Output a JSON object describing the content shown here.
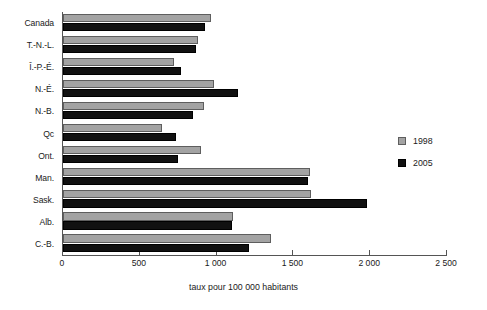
{
  "chart_data": {
    "type": "bar",
    "orientation": "horizontal",
    "title": "",
    "subtitle": "",
    "xlabel": "taux pour 100 000 habitants",
    "ylabel": "",
    "xlim": [
      0,
      2500
    ],
    "xticks": [
      0,
      500,
      1000,
      1500,
      2000,
      2500
    ],
    "xtick_labels": [
      "0",
      "500",
      "1 000",
      "1 500",
      "2 000",
      "2 500"
    ],
    "grid": false,
    "legend_position": "right",
    "categories": [
      "Canada",
      "T.-N.-L.",
      "Î.-P.-É.",
      "N.-É.",
      "N.-B.",
      "Qc",
      "Ont.",
      "Man.",
      "Sask.",
      "Alb.",
      "C.-B."
    ],
    "series": [
      {
        "name": "1998",
        "color": "#a3a3a3",
        "values": [
          963,
          879,
          723,
          983,
          918,
          645,
          898,
          1608,
          1615,
          1107,
          1354
        ]
      },
      {
        "name": "2005",
        "color": "#111111",
        "values": [
          925,
          866,
          768,
          1139,
          846,
          736,
          749,
          1595,
          1979,
          1100,
          1211
        ]
      }
    ]
  },
  "legend": {
    "entries": [
      {
        "label": "1998",
        "swatch": "square-gray-swatch"
      },
      {
        "label": "2005",
        "swatch": "square-black-swatch"
      }
    ]
  }
}
